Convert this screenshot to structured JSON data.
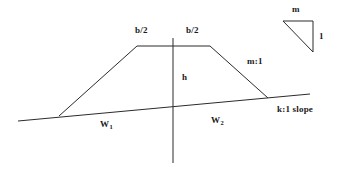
{
  "diagram": {
    "stroke_color": "#2b2b2b",
    "background_color": "#ffffff",
    "labels": {
      "crest_left": "b/2",
      "crest_right": "b/2",
      "height": "h",
      "side_slope": "m:1",
      "ground_slope": "k:1 slope",
      "width_left_main": "W",
      "width_left_sub": "1",
      "width_right_main": "W",
      "width_right_sub": "2",
      "triangle_horizontal": "m",
      "triangle_vertical": "1"
    },
    "geometry": {
      "embankment_outline": "59,116 137,46 210,46 268,98",
      "ground_line": "18,121 310,94",
      "center_line": "173,38 173,163",
      "slope_triangle": "283,21 313,21 313,52"
    }
  }
}
